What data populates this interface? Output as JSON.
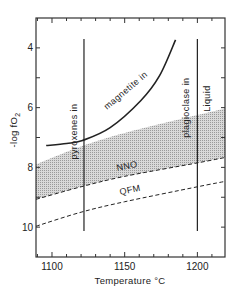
{
  "chart_data": {
    "type": "line",
    "title": "",
    "xlabel": "Temperature °C",
    "ylabel": "-log fO2",
    "ylabel_main": "-log fO",
    "ylabel_sub": "2",
    "xlim": [
      1089,
      1219
    ],
    "ylim": [
      11,
      3
    ],
    "y_inverted": true,
    "grid": false,
    "legend": "none",
    "x_ticks": [
      1100,
      1150,
      1200
    ],
    "x_tick_labels": [
      "1100",
      "1150",
      "1200"
    ],
    "x_minor_step": 10,
    "y_ticks": [
      4,
      6,
      8,
      10
    ],
    "y_tick_labels": [
      "4",
      "6",
      "8",
      "10"
    ],
    "y_minor_step": 1,
    "series": [
      {
        "name": "magnetite in",
        "style": "solid",
        "points": [
          [
            1096,
            7.27
          ],
          [
            1110,
            7.2
          ],
          [
            1121,
            7.1
          ],
          [
            1140,
            6.67
          ],
          [
            1161,
            5.77
          ],
          [
            1174,
            4.93
          ],
          [
            1185,
            3.73
          ]
        ]
      },
      {
        "name": "NNO",
        "style": "dashed",
        "points": [
          [
            1089,
            9.07
          ],
          [
            1120,
            8.65
          ],
          [
            1150,
            8.3
          ],
          [
            1200,
            7.85
          ],
          [
            1219,
            7.67
          ]
        ]
      },
      {
        "name": "QFM",
        "style": "dashed",
        "points": [
          [
            1089,
            9.97
          ],
          [
            1120,
            9.5
          ],
          [
            1150,
            9.15
          ],
          [
            1200,
            8.65
          ],
          [
            1219,
            8.47
          ]
        ]
      },
      {
        "name": "pyroxenes in",
        "style": "solid-vertical",
        "x": 1122,
        "y_range": [
          3.7,
          10.13
        ]
      },
      {
        "name": "plagioclase in",
        "style": "solid-vertical",
        "x": 1200,
        "y_range": [
          3.7,
          10.13
        ]
      }
    ],
    "shaded_region": {
      "name": "stippled band (above NNO)",
      "upper": [
        [
          1089,
          7.9
        ],
        [
          1120,
          7.3
        ],
        [
          1150,
          6.85
        ],
        [
          1200,
          6.25
        ],
        [
          1219,
          6.03
        ]
      ],
      "lower_series": "NNO"
    },
    "annotations": [
      {
        "text": "magnetite in",
        "x": 1152,
        "y": 5.5
      },
      {
        "text": "pyroxenes in",
        "x": 1117,
        "y": 6.8
      },
      {
        "text": "plagioclase in",
        "x": 1194,
        "y": 6.0
      },
      {
        "text": "Liquid",
        "x": 1209,
        "y": 5.7
      },
      {
        "text": "NNO",
        "x": 1152,
        "y": 8.05
      },
      {
        "text": "QFM",
        "x": 1154,
        "y": 8.85
      }
    ]
  }
}
